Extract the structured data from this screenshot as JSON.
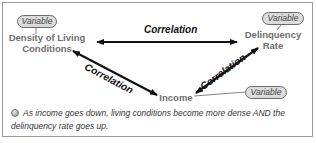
{
  "diagram": {
    "nodes": [
      {
        "id": "density",
        "tag": "Variable",
        "label_line1": "Density of Living",
        "label_line2": "Conditions"
      },
      {
        "id": "delinquency",
        "tag": "Variable",
        "label_line1": "Delinquency",
        "label_line2": "Rate"
      },
      {
        "id": "income",
        "tag": "Variable",
        "label": "Income"
      }
    ],
    "edges": [
      {
        "from": "density",
        "to": "delinquency",
        "label": "Correlation",
        "bidirectional": true
      },
      {
        "from": "density",
        "to": "income",
        "label": "Correlation",
        "bidirectional": true
      },
      {
        "from": "income",
        "to": "delinquency",
        "label": "Correlation",
        "bidirectional": true
      }
    ],
    "note": {
      "icon": "bullet-icon",
      "text": "As income goes down, living conditions become more dense AND the delinquency rate goes up."
    }
  },
  "colors": {
    "frame_border": "#9a9a9a",
    "pill_fill": "#dcdcdc",
    "node_text": "#6e6e6e",
    "arrow": "#111111"
  }
}
